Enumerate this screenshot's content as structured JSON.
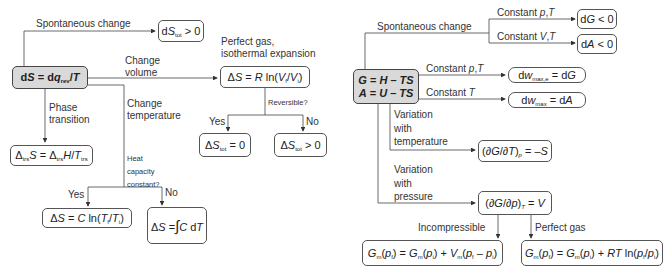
{
  "left_diagram": {
    "hub": {
      "prefix": "dS = dq",
      "sub": "rev",
      "suffix": "/T"
    },
    "branches": {
      "spontaneous": "Spontaneous change",
      "change_volume": [
        "Change",
        "volume"
      ],
      "change_temperature": [
        "Change",
        "temperature"
      ],
      "phase_transition": [
        "Phase",
        "transition"
      ],
      "perfect_gas": [
        "Perfect gas,",
        "isothermal expansion"
      ],
      "reversible": "Reversible?",
      "yes": "Yes",
      "no": "No",
      "heat_capacity": [
        "Heat",
        "capacity",
        "constant?"
      ],
      "yes2": "Yes",
      "no2": "No"
    },
    "boxes": {
      "dstot_gt0": "dS_tot > 0",
      "perfect_gas_expansion": "ΔS = R ln(V_f/V_i)",
      "reversible_yes": "ΔS_tot = 0",
      "reversible_no": "ΔS_tot > 0",
      "phase": "Δ_trs S = Δ_trs H/T_trs",
      "const_cap": "ΔS = C ln(T_f/T_i)",
      "var_cap": "ΔS = ∫ C dT from T_i to T_f"
    }
  },
  "right_diagram": {
    "hub": {
      "line1": "G = H – TS",
      "line2": "A = U – TS"
    },
    "branches": {
      "spontaneous": "Spontaneous change",
      "const_pT_top": "Constant p,T",
      "const_VT": "Constant V,T",
      "const_pT": "Constant p,T",
      "const_T": "Constant T",
      "var_temp": [
        "Variation",
        "with",
        "temperature"
      ],
      "var_pres": [
        "Variation",
        "with",
        "pressure"
      ],
      "incompressible": "Incompressible",
      "perfect_gas": "Perfect gas"
    },
    "boxes": {
      "dG": "dG < 0",
      "dA": "dA < 0",
      "dw_max_e": "dw_max,e = dG",
      "dw_max": "dw_max = dA",
      "dGdT": "(∂G/∂T)_p = –S",
      "dGdp": "(∂G/∂p)_T = V",
      "incompressible_eq": "G_m(p_f) = G_m(p_i) + V_m(p_f – p_i)",
      "perfect_gas_eq": "G_m(p_f) = G_m(p_i) + RT ln(p_f/p_i)"
    }
  }
}
